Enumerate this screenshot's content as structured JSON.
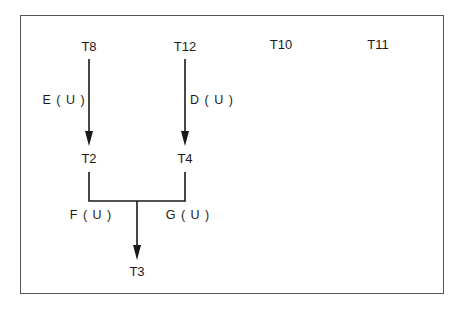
{
  "diagram": {
    "type": "precedence-graph",
    "nodes": [
      {
        "id": "T8",
        "label": "T8"
      },
      {
        "id": "T12",
        "label": "T12"
      },
      {
        "id": "T10",
        "label": "T10"
      },
      {
        "id": "T11",
        "label": "T11"
      },
      {
        "id": "T2",
        "label": "T2"
      },
      {
        "id": "T4",
        "label": "T4"
      },
      {
        "id": "T3",
        "label": "T3"
      }
    ],
    "edges": [
      {
        "from": "T8",
        "to": "T2",
        "label": "E ( U )"
      },
      {
        "from": "T12",
        "to": "T4",
        "label": "D ( U )"
      },
      {
        "from": "T2",
        "to": "T3",
        "label": "F ( U )"
      },
      {
        "from": "T4",
        "to": "T3",
        "label": "G ( U )"
      }
    ]
  },
  "colors": {
    "line": "#1a1a1a",
    "frame": "#555555",
    "background": "#ffffff"
  }
}
